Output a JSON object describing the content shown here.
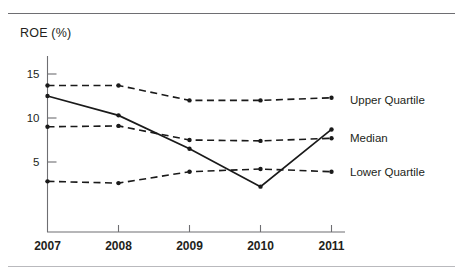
{
  "chart_data": {
    "type": "line",
    "title": "ROE  (%)",
    "xlabel": "",
    "ylabel": "ROE (%)",
    "categories": [
      "2007",
      "2008",
      "2009",
      "2010",
      "2011"
    ],
    "x_tick_labels": [
      "2007",
      "2008",
      "2009",
      "2010",
      "2011"
    ],
    "y_tick_labels": [
      "15",
      "10",
      "5"
    ],
    "y_tick_values": [
      15,
      10,
      5
    ],
    "ylim": [
      0,
      16.5
    ],
    "grid": false,
    "legend_position": "right-inline",
    "series": [
      {
        "name": "Upper Quartile",
        "style": "dashed",
        "values": [
          13.7,
          13.7,
          12.0,
          12.0,
          12.3
        ]
      },
      {
        "name": "Median",
        "style": "dashed",
        "values": [
          9.0,
          9.1,
          7.5,
          7.4,
          7.7
        ]
      },
      {
        "name": "Lower Quartile",
        "style": "dashed",
        "values": [
          2.8,
          2.6,
          3.9,
          4.2,
          3.9
        ]
      },
      {
        "name": "Company",
        "style": "solid",
        "values": [
          12.5,
          10.3,
          6.5,
          2.2,
          8.7
        ]
      }
    ],
    "annotations": [
      {
        "text": "Upper Quartile",
        "value": 12.0
      },
      {
        "text": "Median",
        "value": 7.7
      },
      {
        "text": "Lower Quartile",
        "value": 3.9
      }
    ]
  }
}
